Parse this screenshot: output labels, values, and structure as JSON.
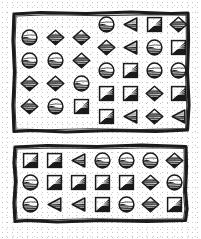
{
  "document": {
    "title": "Shape Grid Panels",
    "background_color": "#ffffff",
    "ink_color": "#1a1a1a",
    "style": "hand-drawn scanned line art, hatched shading"
  },
  "shape_glyphs": {
    "circle": "shaded-circle-icon",
    "diamond": "shaded-diamond-icon",
    "square": "shaded-square-icon",
    "triangle": "shaded-left-triangle-icon"
  },
  "panels": [
    {
      "id": "top-panel",
      "name": "top-panel",
      "blocks": [
        {
          "id": "top-left-block",
          "name": "top-left-shape-grid",
          "rows": 4,
          "cols": 3,
          "cells": [
            "circle",
            "diamond",
            "diamond",
            "circle",
            "circle",
            "diamond",
            "diamond",
            "diamond",
            "circle",
            "diamond",
            "circle",
            "square"
          ]
        },
        {
          "id": "top-right-block",
          "name": "top-right-shape-grid",
          "rows": 5,
          "cols": 4,
          "cells": [
            "circle",
            "triangle",
            "square",
            "diamond",
            "diamond",
            "triangle",
            "circle",
            "square",
            "circle",
            "square",
            "circle",
            "circle",
            "square",
            "square",
            "diamond",
            "square",
            "square",
            "triangle",
            "diamond",
            "triangle"
          ]
        }
      ]
    },
    {
      "id": "bottom-panel",
      "name": "bottom-panel",
      "blocks": [
        {
          "id": "bottom-block",
          "name": "bottom-shape-grid",
          "rows": 3,
          "cols": 7,
          "cells": [
            "square",
            "square",
            "triangle",
            "circle",
            "circle",
            "circle",
            "diamond",
            "circle",
            "square",
            "square",
            "square",
            "square",
            "diamond",
            "circle",
            "circle",
            "triangle",
            "triangle",
            "square",
            "circle",
            "diamond",
            "square"
          ]
        }
      ]
    }
  ],
  "counts": {
    "total_shapes": 54,
    "top_panel_shapes": 32,
    "bottom_panel_shapes": 21
  }
}
